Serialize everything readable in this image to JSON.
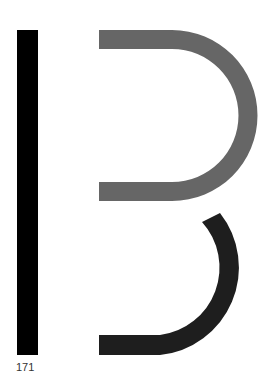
{
  "figure": {
    "label": "171",
    "colors": {
      "background": "#ffffff",
      "vertical_bar": "#000000",
      "upper_bowl": "#666666",
      "lower_bowl": "#1e1e1e"
    }
  }
}
